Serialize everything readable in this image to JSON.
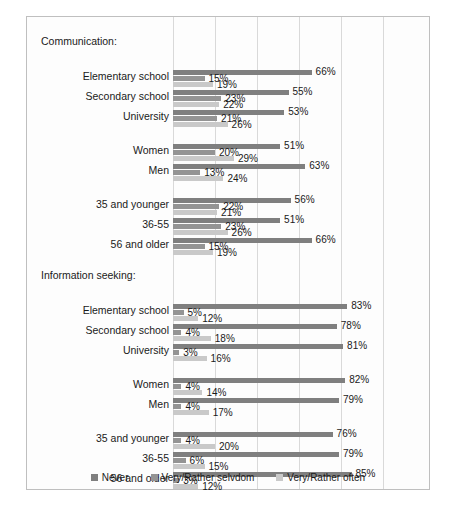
{
  "chart_data": {
    "type": "bar",
    "orientation": "horizontal",
    "title": "",
    "xlabel": "",
    "ylabel": "",
    "xlim": [
      0,
      100
    ],
    "grid": true,
    "gridlines": [
      0,
      20,
      40,
      60,
      80,
      100
    ],
    "legend_position": "bottom",
    "series_names": [
      "Never",
      "Very/Rather selvdom",
      "Very/Rather often"
    ],
    "series_colors": [
      "#7f7f7f",
      "#949494",
      "#c9c9c9"
    ],
    "sections": [
      {
        "title": "Communication:",
        "groups": [
          {
            "rows": [
              {
                "label": "Elementary school",
                "values": [
                  66,
                  15,
                  19
                ]
              },
              {
                "label": "Secondary school",
                "values": [
                  55,
                  23,
                  22
                ]
              },
              {
                "label": "University",
                "values": [
                  53,
                  21,
                  26
                ]
              }
            ]
          },
          {
            "rows": [
              {
                "label": "Women",
                "values": [
                  51,
                  20,
                  29
                ]
              },
              {
                "label": "Men",
                "values": [
                  63,
                  13,
                  24
                ]
              }
            ]
          },
          {
            "rows": [
              {
                "label": "35 and younger",
                "values": [
                  56,
                  22,
                  21
                ]
              },
              {
                "label": "36-55",
                "values": [
                  51,
                  23,
                  26
                ]
              },
              {
                "label": "56 and older",
                "values": [
                  66,
                  15,
                  19
                ]
              }
            ]
          }
        ]
      },
      {
        "title": "Information seeking:",
        "groups": [
          {
            "rows": [
              {
                "label": "Elementary school",
                "values": [
                  83,
                  5,
                  12
                ]
              },
              {
                "label": "Secondary school",
                "values": [
                  78,
                  4,
                  18
                ]
              },
              {
                "label": "University",
                "values": [
                  81,
                  3,
                  16
                ]
              }
            ]
          },
          {
            "rows": [
              {
                "label": "Women",
                "values": [
                  82,
                  4,
                  14
                ]
              },
              {
                "label": "Men",
                "values": [
                  79,
                  4,
                  17
                ]
              }
            ]
          },
          {
            "rows": [
              {
                "label": "35 and younger",
                "values": [
                  76,
                  4,
                  20
                ]
              },
              {
                "label": "36-55",
                "values": [
                  79,
                  6,
                  15
                ]
              },
              {
                "label": "56 and older",
                "values": [
                  85,
                  3,
                  12
                ]
              }
            ]
          }
        ]
      }
    ]
  },
  "legend": {
    "items": [
      {
        "label": "Never"
      },
      {
        "label": "Very/Rather selvdom"
      },
      {
        "label": "Very/Rather often"
      }
    ]
  },
  "caption": {
    "text": ""
  }
}
